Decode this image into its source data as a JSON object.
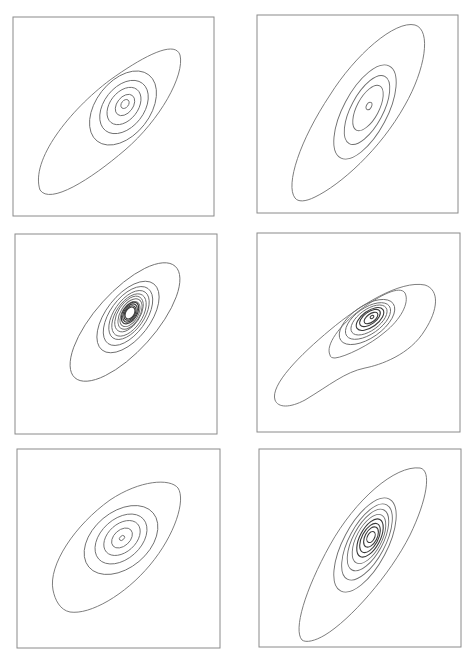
{
  "figure": {
    "width": 473,
    "height": 662,
    "background": "#ffffff",
    "frame_color": "#8a8a8a",
    "contour_color": "#6e6e6e",
    "inner_contour_color": "#3a3a3a"
  },
  "chart_data": [
    {
      "type": "contour",
      "title": "",
      "xlabel": "",
      "ylabel": "",
      "panel_position": "row 1, col 1",
      "frame": {
        "x": 13,
        "y": 17,
        "w": 201,
        "h": 199
      },
      "peak": {
        "x": 125,
        "y": 105
      },
      "n_levels": 6,
      "orientation": "positive correlation, ~40deg",
      "contours": [
        {
          "kind": "path",
          "d": "M 40,190 C 30,160 70,110 110,80 C 145,55 175,40 180,55 C 185,75 160,120 125,150 C 90,180 50,205 40,190 Z"
        },
        {
          "kind": "ellipse",
          "cx": 123,
          "cy": 108,
          "rx": 42,
          "ry": 27,
          "rot": -52
        },
        {
          "kind": "ellipse",
          "cx": 124,
          "cy": 107,
          "rx": 30,
          "ry": 20,
          "rot": -52
        },
        {
          "kind": "ellipse",
          "cx": 124,
          "cy": 106,
          "rx": 21,
          "ry": 14,
          "rot": -52
        },
        {
          "kind": "ellipse",
          "cx": 125,
          "cy": 105,
          "rx": 12,
          "ry": 8,
          "rot": -52
        },
        {
          "kind": "ellipse",
          "cx": 125,
          "cy": 104,
          "rx": 5,
          "ry": 3.5,
          "rot": -52
        }
      ]
    },
    {
      "type": "contour",
      "title": "",
      "xlabel": "",
      "ylabel": "",
      "panel_position": "row 1, col 2",
      "frame": {
        "x": 257,
        "y": 15,
        "w": 201,
        "h": 198
      },
      "peak": {
        "x": 369,
        "y": 106
      },
      "n_levels": 5,
      "orientation": "strong positive correlation, ~60deg",
      "contours": [
        {
          "kind": "path",
          "d": "M 295,198 C 285,185 300,140 330,95 C 355,55 395,20 415,25 C 432,30 425,70 405,105 C 380,150 340,185 315,197 C 305,202 298,202 295,198 Z"
        },
        {
          "kind": "ellipse",
          "cx": 365,
          "cy": 112,
          "rx": 52,
          "ry": 22,
          "rot": -62
        },
        {
          "kind": "ellipse",
          "cx": 367,
          "cy": 110,
          "rx": 38,
          "ry": 16,
          "rot": -62
        },
        {
          "kind": "ellipse",
          "cx": 368,
          "cy": 108,
          "rx": 25,
          "ry": 11,
          "rot": -62
        },
        {
          "kind": "ellipse",
          "cx": 369,
          "cy": 106,
          "rx": 4,
          "ry": 2.5,
          "rot": -62
        }
      ]
    },
    {
      "type": "contour",
      "title": "",
      "xlabel": "",
      "ylabel": "",
      "panel_position": "row 2, col 1",
      "frame": {
        "x": 15,
        "y": 234,
        "w": 202,
        "h": 200
      },
      "peak": {
        "x": 130,
        "y": 313
      },
      "n_levels": 12,
      "orientation": "positive correlation, sharply peaked",
      "contours": [
        {
          "kind": "ellipse",
          "cx": 125,
          "cy": 322,
          "rx": 75,
          "ry": 30,
          "rot": -48
        },
        {
          "kind": "ellipse",
          "cx": 128,
          "cy": 317,
          "rx": 42,
          "ry": 22,
          "rot": -52
        },
        {
          "kind": "ellipse",
          "cx": 128,
          "cy": 316,
          "rx": 34,
          "ry": 18,
          "rot": -54
        },
        {
          "kind": "ellipse",
          "cx": 129,
          "cy": 315,
          "rx": 28,
          "ry": 15,
          "rot": -55
        },
        {
          "kind": "ellipse",
          "cx": 129,
          "cy": 315,
          "rx": 24,
          "ry": 13,
          "rot": -56
        },
        {
          "kind": "ellipse",
          "cx": 129,
          "cy": 314,
          "rx": 20,
          "ry": 11,
          "rot": -57
        },
        {
          "kind": "ellipse",
          "cx": 130,
          "cy": 314,
          "rx": 17,
          "ry": 9.5,
          "rot": -58
        },
        {
          "kind": "ellipse",
          "cx": 130,
          "cy": 314,
          "rx": 14,
          "ry": 8,
          "rot": -58
        },
        {
          "kind": "ellipse",
          "cx": 130,
          "cy": 313,
          "rx": 12,
          "ry": 7,
          "rot": -58
        },
        {
          "kind": "ellipse",
          "cx": 130,
          "cy": 313,
          "rx": 10,
          "ry": 6,
          "rot": -58
        },
        {
          "kind": "ellipse",
          "cx": 130,
          "cy": 313,
          "rx": 8,
          "ry": 5,
          "rot": -58
        },
        {
          "kind": "ellipse",
          "cx": 130,
          "cy": 313,
          "rx": 6.5,
          "ry": 4.2,
          "rot": -58
        }
      ]
    },
    {
      "type": "contour",
      "title": "",
      "xlabel": "",
      "ylabel": "",
      "panel_position": "row 2, col 2",
      "frame": {
        "x": 257,
        "y": 233,
        "w": 203,
        "h": 199
      },
      "peak": {
        "x": 371,
        "y": 317
      },
      "n_levels": 9,
      "orientation": "positive correlation, skewed tail toward lower-left",
      "contours": [
        {
          "kind": "path",
          "d": "M 275,400 C 270,385 300,355 330,330 C 360,305 400,280 425,285 C 440,290 438,310 425,330 C 410,355 380,365 365,368 C 345,372 330,385 305,400 C 290,408 278,408 275,400 Z"
        },
        {
          "kind": "path",
          "d": "M 330,355 C 325,345 340,325 360,310 C 380,295 400,285 405,293 C 410,303 400,320 385,332 C 370,345 345,357 335,358 C 332,358 330,357 330,355 Z"
        },
        {
          "kind": "ellipse",
          "cx": 367,
          "cy": 322,
          "rx": 32,
          "ry": 16,
          "rot": -35
        },
        {
          "kind": "ellipse",
          "cx": 368,
          "cy": 321,
          "rx": 26,
          "ry": 13,
          "rot": -35
        },
        {
          "kind": "ellipse",
          "cx": 369,
          "cy": 320,
          "rx": 21,
          "ry": 10.5,
          "rot": -36
        },
        {
          "kind": "ellipse",
          "cx": 370,
          "cy": 319,
          "rx": 16,
          "ry": 8,
          "rot": -36
        },
        {
          "kind": "ellipse",
          "cx": 370,
          "cy": 318,
          "rx": 12,
          "ry": 6,
          "rot": -36
        },
        {
          "kind": "ellipse",
          "cx": 371,
          "cy": 318,
          "rx": 8,
          "ry": 4,
          "rot": -36
        },
        {
          "kind": "ellipse",
          "cx": 372,
          "cy": 317,
          "rx": 2,
          "ry": 1.4,
          "rot": -36
        }
      ]
    },
    {
      "type": "contour",
      "title": "",
      "xlabel": "",
      "ylabel": "",
      "panel_position": "row 3, col 1",
      "frame": {
        "x": 17,
        "y": 449,
        "w": 203,
        "h": 199
      },
      "peak": {
        "x": 122,
        "y": 538
      },
      "n_levels": 6,
      "orientation": "moderate positive correlation, ~40deg",
      "contours": [
        {
          "kind": "path",
          "d": "M 53,590 C 48,565 75,525 110,500 C 140,480 170,478 178,488 C 186,500 175,535 150,565 C 125,595 90,615 70,612 C 60,610 55,600 53,590 Z"
        },
        {
          "kind": "ellipse",
          "cx": 121,
          "cy": 540,
          "rx": 42,
          "ry": 28,
          "rot": -40
        },
        {
          "kind": "ellipse",
          "cx": 121,
          "cy": 539,
          "rx": 30,
          "ry": 20,
          "rot": -42
        },
        {
          "kind": "ellipse",
          "cx": 122,
          "cy": 538,
          "rx": 21,
          "ry": 14,
          "rot": -42
        },
        {
          "kind": "ellipse",
          "cx": 122,
          "cy": 538,
          "rx": 12,
          "ry": 8,
          "rot": -42
        },
        {
          "kind": "ellipse",
          "cx": 122,
          "cy": 538,
          "rx": 3,
          "ry": 2,
          "rot": -42
        }
      ]
    },
    {
      "type": "contour",
      "title": "",
      "xlabel": "",
      "ylabel": "",
      "panel_position": "row 3, col 2",
      "frame": {
        "x": 259,
        "y": 449,
        "w": 202,
        "h": 198
      },
      "peak": {
        "x": 371,
        "y": 537
      },
      "n_levels": 9,
      "orientation": "strong positive correlation, ~62deg",
      "contours": [
        {
          "kind": "path",
          "d": "M 302,640 C 293,630 305,590 330,545 C 355,500 395,465 420,468 C 432,470 427,500 410,535 C 390,575 350,620 325,635 C 315,641 306,643 302,640 Z"
        },
        {
          "kind": "ellipse",
          "cx": 365,
          "cy": 545,
          "rx": 52,
          "ry": 22,
          "rot": -62
        },
        {
          "kind": "ellipse",
          "cx": 367,
          "cy": 542,
          "rx": 42,
          "ry": 18,
          "rot": -62
        },
        {
          "kind": "ellipse",
          "cx": 368,
          "cy": 540,
          "rx": 34,
          "ry": 15,
          "rot": -62
        },
        {
          "kind": "ellipse",
          "cx": 369,
          "cy": 539,
          "rx": 27,
          "ry": 12.5,
          "rot": -62
        },
        {
          "kind": "ellipse",
          "cx": 370,
          "cy": 538,
          "rx": 21,
          "ry": 10,
          "rot": -62
        },
        {
          "kind": "ellipse",
          "cx": 370,
          "cy": 538,
          "rx": 16,
          "ry": 8,
          "rot": -62
        },
        {
          "kind": "ellipse",
          "cx": 371,
          "cy": 537,
          "rx": 11,
          "ry": 6,
          "rot": -62
        },
        {
          "kind": "ellipse",
          "cx": 371,
          "cy": 537,
          "rx": 6,
          "ry": 3.5,
          "rot": -62
        }
      ]
    }
  ]
}
